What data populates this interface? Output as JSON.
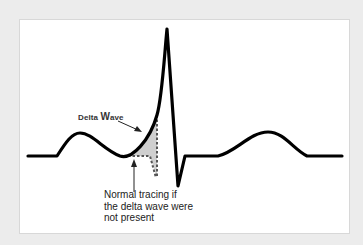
{
  "figure": {
    "background_color": "#ececec",
    "panel_color": "#ffffff",
    "trace_color": "#000000",
    "shade_color": "#cfcfcf"
  },
  "labels": {
    "delta_wave_prefix": "Delta ",
    "delta_wave_big": "W",
    "delta_wave_suffix": "ave",
    "normal_tracing_line1": "Normal tracing if",
    "normal_tracing_line2": "the delta wave were",
    "normal_tracing_line3": "not present"
  },
  "icons": {
    "delta_arrow": "arrow-pointing-down-right-icon",
    "normal_arrow": "arrow-pointing-up-icon"
  }
}
